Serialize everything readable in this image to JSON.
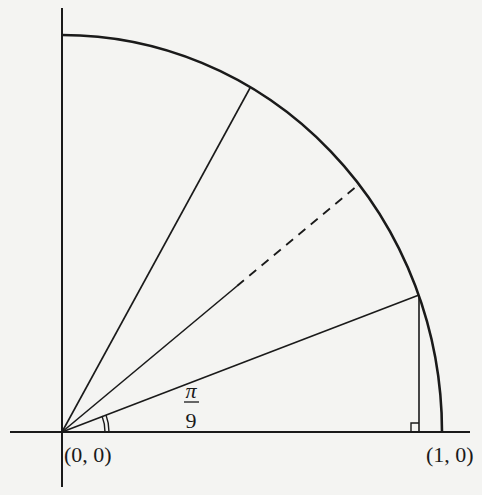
{
  "diagram": {
    "colors": {
      "background": "#f4f4f2",
      "ink": "#1a1a1a"
    },
    "labels": {
      "origin": "(0, 0)",
      "unit_point": "(1, 0)",
      "angle_numerator": "π",
      "angle_denominator": "9"
    },
    "rays": [
      {
        "angle": "π/9",
        "style": "solid"
      },
      {
        "angle": "2π/9",
        "style": "solid"
      },
      {
        "angle": "2π/9 (dashed extension)",
        "style": "dashed"
      },
      {
        "angle": "π/3",
        "style": "solid"
      }
    ],
    "annotations": {
      "angle_marker": "double arc at origin",
      "right_angle_marker": "square at foot of perpendicular"
    }
  }
}
